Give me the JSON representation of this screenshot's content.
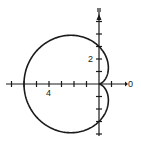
{
  "diagram": {
    "type": "polar-curve",
    "curve": "cardioid",
    "equation": "r = 3 - 3cos(theta)",
    "labels": {
      "x_axis_label": "0",
      "x_tick_label": "4",
      "y_tick_label": "2"
    },
    "colors": {
      "stroke": "#1a1a1a",
      "background": "#ffffff"
    },
    "origin_px": [
      99,
      84
    ],
    "unit_px": 12.5,
    "x_ticks": [
      -7,
      -6,
      -5,
      -4,
      -3,
      -2,
      -1,
      1
    ],
    "y_ticks": [
      -5,
      -4,
      -3,
      -2,
      -1,
      1,
      2,
      3,
      4,
      5
    ],
    "amplitude": 3
  }
}
